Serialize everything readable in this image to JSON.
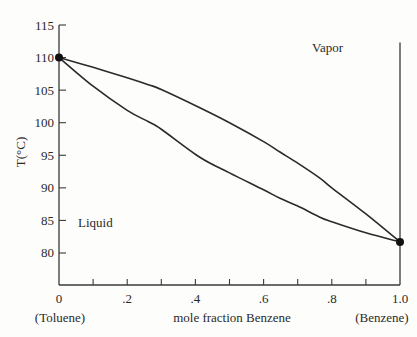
{
  "chart_data": {
    "type": "line",
    "title": "",
    "xlabel": "mole fraction Benzene",
    "ylabel": "T(°C)",
    "xlim": [
      0,
      1.0
    ],
    "ylim": [
      75,
      115
    ],
    "grid": false,
    "x_ticks": [
      0,
      0.1,
      0.2,
      0.3,
      0.4,
      0.5,
      0.6,
      0.7,
      0.8,
      0.9,
      1.0
    ],
    "x_tick_labels": [
      {
        "x": 0,
        "label": "0"
      },
      {
        "x": 0.2,
        "label": ".2"
      },
      {
        "x": 0.4,
        "label": ".4"
      },
      {
        "x": 0.6,
        "label": ".6"
      },
      {
        "x": 0.8,
        "label": ".8"
      },
      {
        "x": 1.0,
        "label": "1.0"
      }
    ],
    "y_ticks": [
      80,
      85,
      90,
      95,
      100,
      105,
      110,
      115
    ],
    "y_tick_labels": [
      "80",
      "85",
      "90",
      "95",
      "100",
      "105",
      "110",
      "115"
    ],
    "endpoint_labels": {
      "left": "(Toluene)",
      "right": "(Benzene)"
    },
    "region_labels": [
      {
        "text": "Vapor",
        "x": 0.83,
        "y": 112.5
      },
      {
        "text": "Liquid",
        "x": 0.05,
        "y": 84.6
      }
    ],
    "series": [
      {
        "name": "Vapor curve (dew point)",
        "x": [
          0,
          0.1,
          0.2,
          0.264,
          0.3,
          0.413,
          0.5,
          0.6,
          0.648,
          0.7,
          0.765,
          0.8,
          0.9,
          1.0
        ],
        "y": [
          110.0,
          108.5,
          106.9,
          105.8,
          105.1,
          102.3,
          100.0,
          97.1,
          95.5,
          93.8,
          91.5,
          90.0,
          86.0,
          81.7
        ]
      },
      {
        "name": "Liquid curve (bubble point)",
        "x": [
          0,
          0.1,
          0.2,
          0.264,
          0.3,
          0.413,
          0.5,
          0.6,
          0.648,
          0.7,
          0.765,
          0.8,
          0.9,
          1.0
        ],
        "y": [
          110.0,
          105.6,
          101.9,
          100.1,
          99.0,
          94.7,
          92.3,
          89.7,
          88.4,
          87.2,
          85.5,
          84.8,
          83.1,
          81.7
        ]
      }
    ],
    "points": [
      {
        "x": 0,
        "y": 110.0,
        "label": "Toluene boiling point"
      },
      {
        "x": 1.0,
        "y": 81.7,
        "label": "Benzene boiling point"
      }
    ]
  }
}
